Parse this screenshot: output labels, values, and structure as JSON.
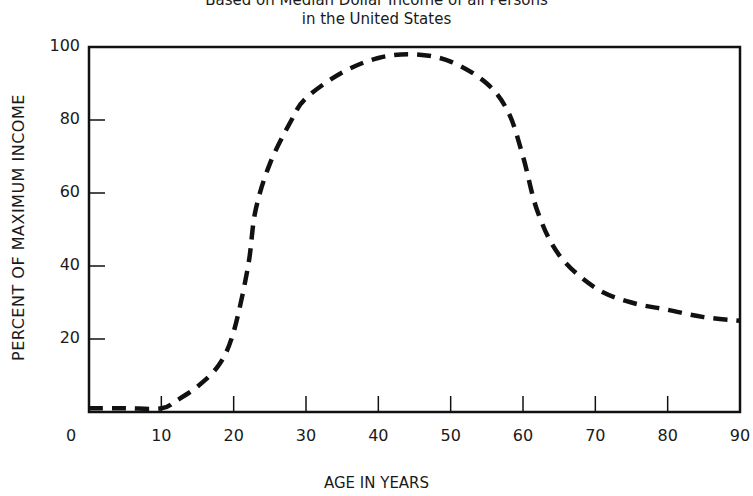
{
  "chart_data": {
    "type": "line",
    "title": "Based on Median Dollar Income of all Persons",
    "subtitle": "in the United States",
    "xlabel": "AGE IN YEARS",
    "ylabel": "PERCENT OF MAXIMUM INCOME",
    "xlim": [
      0,
      90
    ],
    "ylim": [
      0,
      100
    ],
    "x_ticks": [
      0,
      10,
      20,
      30,
      40,
      50,
      60,
      70,
      80,
      90
    ],
    "y_ticks": [
      20,
      40,
      60,
      80,
      100
    ],
    "grid": false,
    "legend": null,
    "series": [
      {
        "name": "Percent of maximum income",
        "style": "dashed",
        "x": [
          0,
          5,
          10,
          12,
          15,
          18,
          20,
          22,
          23,
          25,
          28,
          30,
          35,
          40,
          45,
          50,
          55,
          58,
          60,
          62,
          65,
          70,
          75,
          80,
          85,
          90
        ],
        "values": [
          1,
          1,
          1,
          3,
          7,
          13,
          22,
          40,
          55,
          68,
          80,
          86,
          93,
          97,
          98,
          96,
          90,
          82,
          70,
          55,
          43,
          34,
          30,
          28,
          26,
          25
        ]
      }
    ]
  },
  "labels": {
    "title_line1": "Based on Median Dollar Income of all Persons",
    "title_line2": "in the United States",
    "xlabel": "AGE IN YEARS",
    "ylabel": "PERCENT OF MAXIMUM INCOME",
    "x_ticks": [
      "0",
      "10",
      "20",
      "30",
      "40",
      "50",
      "60",
      "70",
      "80",
      "90"
    ],
    "y_ticks": [
      "20",
      "40",
      "60",
      "80",
      "100"
    ]
  },
  "colors": {
    "line": "#111111",
    "axis": "#111111",
    "background": "#ffffff"
  }
}
